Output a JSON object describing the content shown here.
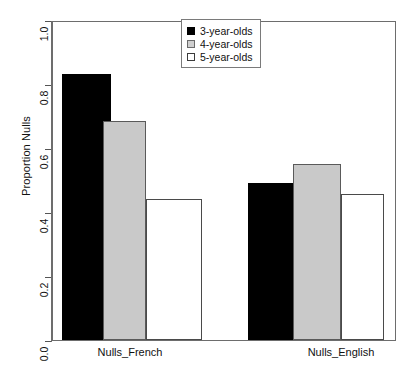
{
  "chart_data": {
    "type": "bar",
    "title": "",
    "xlabel": "",
    "ylabel": "Proportion Nulls",
    "ylim": [
      0.0,
      1.0
    ],
    "grid": false,
    "legend_position": "top-center",
    "categories": [
      "Nulls_French",
      "Nulls_English"
    ],
    "ytick_labels": [
      "0.0",
      "0.2",
      "0.4",
      "0.6",
      "0.8",
      "1.0"
    ],
    "ytick_values": [
      0.0,
      0.2,
      0.4,
      0.6,
      0.8,
      1.0
    ],
    "series": [
      {
        "name": "3-year-olds",
        "color": "#000000",
        "values": [
          0.83,
          0.49
        ]
      },
      {
        "name": "4-year-olds",
        "color": "#c9c9c9",
        "values": [
          0.685,
          0.55
        ]
      },
      {
        "name": "5-year-olds",
        "color": "#ffffff",
        "values": [
          0.44,
          0.455
        ]
      }
    ]
  },
  "legend": {
    "items": [
      {
        "label": "3-year-olds",
        "swatch": "black"
      },
      {
        "label": "4-year-olds",
        "swatch": "gray"
      },
      {
        "label": "5-year-olds",
        "swatch": "white"
      }
    ]
  },
  "axes": {
    "y_title": "Proportion Nulls"
  },
  "caption": {
    "text": ""
  }
}
